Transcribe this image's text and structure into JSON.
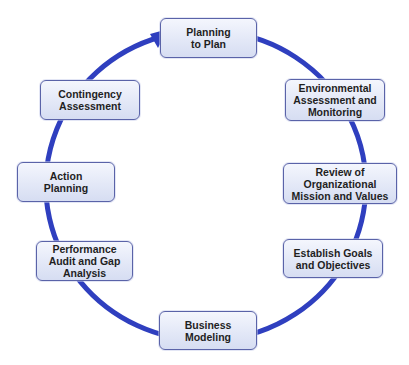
{
  "diagram": {
    "type": "cycle",
    "direction": "clockwise",
    "colors": {
      "ring": "#2f3fbf",
      "node_border": "#5a63a8",
      "node_fill_top": "#f4f6fd",
      "node_fill_bottom": "#d6ddf2",
      "text": "#1f1f1f"
    },
    "nodes": [
      {
        "id": "planning-to-plan",
        "label": "Planning\nto Plan"
      },
      {
        "id": "environmental-assessment",
        "label": "Environmental\nAssessment and\nMonitoring"
      },
      {
        "id": "review-mission",
        "label": "Review of\nOrganizational\nMission and Values"
      },
      {
        "id": "establish-goals",
        "label": "Establish Goals\nand Objectives"
      },
      {
        "id": "business-modeling",
        "label": "Business\nModeling"
      },
      {
        "id": "performance-audit",
        "label": "Performance\nAudit and Gap\nAnalysis"
      },
      {
        "id": "action-planning",
        "label": "Action\nPlanning"
      },
      {
        "id": "contingency-assessment",
        "label": "Contingency\nAssessment"
      }
    ]
  }
}
